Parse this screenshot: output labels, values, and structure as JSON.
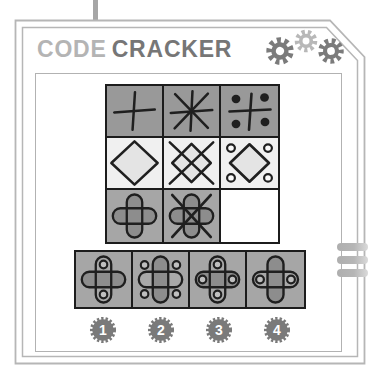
{
  "header": {
    "title_word1": "CODE",
    "title_word2": "CRACKER",
    "icons": [
      "gear-icon",
      "gear-icon",
      "gear-icon"
    ]
  },
  "puzzle": {
    "grid_rows": [
      {
        "background": "#999999",
        "cells": [
          "plus",
          "asterisk",
          "plus-quadrant-dots"
        ]
      },
      {
        "background": "#f0f0f0",
        "cells": [
          "diamond",
          "diamond-x",
          "diamond-corner-rings"
        ]
      },
      {
        "background": "#a6a6a6",
        "cells": [
          "rounded-cross",
          "rounded-cross-x",
          "empty"
        ]
      }
    ],
    "empty_cell_background": "#ffffff"
  },
  "options": [
    {
      "number": "1",
      "symbol": "cross-rings-top-bottom"
    },
    {
      "number": "2",
      "symbol": "cross-rings-quadrants"
    },
    {
      "number": "3",
      "symbol": "cross-rings-all-ends"
    },
    {
      "number": "4",
      "symbol": "cross-rings-left-right"
    }
  ],
  "decorations": {
    "side_tabs_count": 3
  },
  "colors": {
    "title_light": "#b4b4b4",
    "title_dark": "#767676",
    "gear_dark": "#7b7b7b",
    "gear_light": "#b8b8b8",
    "badge": "#7a7a7a",
    "card_border": "#b6b6b6",
    "symbol_stroke": "#1f1f1f",
    "cross_fill_dark": "#8d8d8d",
    "cross_fill_light": "#a9a9a9",
    "diamond_fill": "#e4e4e4",
    "ring_fill": "#bfbfbf"
  }
}
